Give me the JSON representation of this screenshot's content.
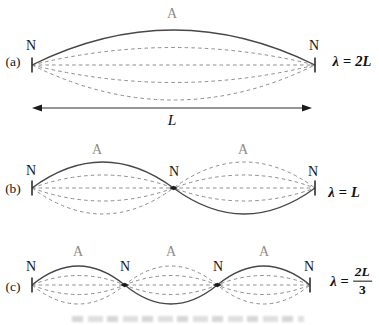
{
  "palette": {
    "background": "#ffffff",
    "solid_curve": "#474747",
    "dashed_curve": "#8c8c8c",
    "node_text": "#161616",
    "antinode_text": "#8f8c86",
    "math_text": "#111111"
  },
  "figure": {
    "width": 379,
    "height": 325,
    "panels": [
      {
        "id": "a",
        "panel_label": "(a)",
        "x_start": 32,
        "x_end": 315,
        "baseline_y": 65,
        "amplitude": 35,
        "loops": 1,
        "snapshot_fractions": [
          0.5,
          0,
          -0.5,
          -1
        ],
        "node_labels": [
          {
            "text": "N",
            "x": 31,
            "y": 46
          },
          {
            "text": "N",
            "x": 314,
            "y": 46
          }
        ],
        "antinode_labels": [
          {
            "text": "A",
            "x": 172,
            "y": 14
          }
        ],
        "panel_label_pos": {
          "x": 13,
          "y": 62
        },
        "wavelength": {
          "symbol": "λ",
          "eq": "=",
          "value": "2L",
          "x": 352,
          "y": 61
        }
      },
      {
        "id": "b",
        "panel_label": "(b)",
        "x_start": 32,
        "x_end": 315,
        "baseline_y": 188,
        "amplitude": 26,
        "loops": 2,
        "snapshot_fractions": [
          0.5,
          0,
          -0.5,
          -1
        ],
        "node_labels": [
          {
            "text": "N",
            "x": 31,
            "y": 171
          },
          {
            "text": "N",
            "x": 174,
            "y": 172
          },
          {
            "text": "N",
            "x": 313,
            "y": 172
          }
        ],
        "antinode_labels": [
          {
            "text": "A",
            "x": 97,
            "y": 150
          },
          {
            "text": "A",
            "x": 243,
            "y": 150
          }
        ],
        "panel_label_pos": {
          "x": 13,
          "y": 189
        },
        "wavelength": {
          "symbol": "λ",
          "eq": "=",
          "value": "L",
          "x": 344,
          "y": 192
        }
      },
      {
        "id": "c",
        "panel_label": "(c)",
        "x_start": 32,
        "x_end": 310,
        "baseline_y": 285,
        "amplitude": 19,
        "loops": 3,
        "snapshot_fractions": [
          0.5,
          0,
          -0.5,
          -1
        ],
        "node_labels": [
          {
            "text": "N",
            "x": 31,
            "y": 267
          },
          {
            "text": "N",
            "x": 125,
            "y": 267
          },
          {
            "text": "N",
            "x": 218,
            "y": 267
          },
          {
            "text": "N",
            "x": 309,
            "y": 267
          }
        ],
        "antinode_labels": [
          {
            "text": "A",
            "x": 78,
            "y": 252
          },
          {
            "text": "A",
            "x": 171,
            "y": 252
          },
          {
            "text": "A",
            "x": 264,
            "y": 252
          }
        ],
        "panel_label_pos": {
          "x": 13,
          "y": 287
        },
        "wavelength": {
          "symbol": "λ",
          "eq": "=",
          "value_num": "2L",
          "value_den": "3",
          "x": 351,
          "y": 281
        }
      }
    ],
    "length_arrow": {
      "x_start": 32,
      "x_end": 312,
      "y": 108,
      "label": "L",
      "label_x": 172,
      "label_y": 120
    }
  }
}
